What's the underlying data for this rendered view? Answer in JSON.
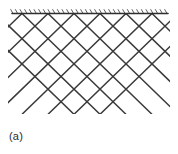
{
  "figure": {
    "caption": "(a)",
    "kind": "lattice-truss-diagram",
    "background_color": "#ffffff",
    "line_color": "#3a3a3a",
    "support_line_color": "#2e2e2e",
    "hatch_color": "#4a4a4a"
  },
  "support": {
    "label": "fixed-support-line",
    "x_start": 12,
    "x_end": 168,
    "y": 13.5,
    "stroke_width": 1.6,
    "hatch": {
      "count": 34,
      "x_start": 13,
      "x_end": 167,
      "length": 4.5,
      "angle_deg": 60,
      "stroke_width": 0.9
    }
  },
  "lattice": {
    "label": "diagonal-cross-brace-lattice",
    "top_y": 13.5,
    "bottom_y": 114,
    "left_clip": 8,
    "right_clip": 170,
    "cell_half_width": 13,
    "cell_half_height": 12.6,
    "top_vertices_x": [
      22,
      48,
      74,
      100,
      126,
      152
    ],
    "stroke_width": 1.5,
    "rows": 4,
    "down_right_lines": [
      {
        "x_at_top": -30
      },
      {
        "x_at_top": -4
      },
      {
        "x_at_top": 22
      },
      {
        "x_at_top": 48
      },
      {
        "x_at_top": 74
      },
      {
        "x_at_top": 100
      },
      {
        "x_at_top": 126
      },
      {
        "x_at_top": 152
      }
    ],
    "down_left_lines": [
      {
        "x_at_top": 22
      },
      {
        "x_at_top": 48
      },
      {
        "x_at_top": 74
      },
      {
        "x_at_top": 100
      },
      {
        "x_at_top": 126
      },
      {
        "x_at_top": 152
      },
      {
        "x_at_top": 178
      },
      {
        "x_at_top": 204
      }
    ]
  }
}
